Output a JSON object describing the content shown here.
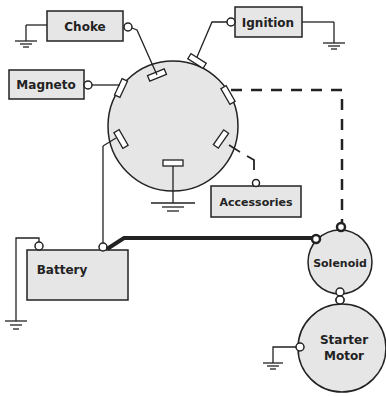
{
  "diagram": {
    "components": {
      "choke": {
        "label": "Choke"
      },
      "ignition": {
        "label": "Ignition"
      },
      "magneto": {
        "label": "Magneto"
      },
      "accessories": {
        "label": "Accessories"
      },
      "battery": {
        "label": "Battery"
      },
      "solenoid": {
        "label": "Solenoid"
      },
      "starter_line1": {
        "label": "Starter"
      },
      "starter_line2": {
        "label": "Motor"
      }
    },
    "colors": {
      "fill": "#e6e6e6",
      "stroke": "#222222",
      "background": "#ffffff"
    }
  }
}
